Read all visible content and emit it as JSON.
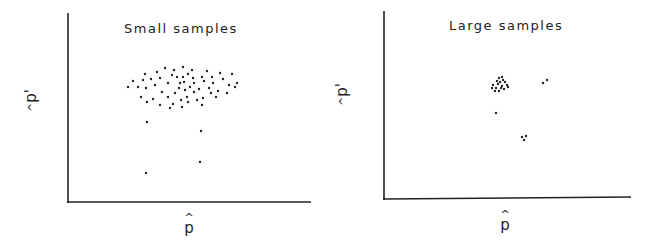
{
  "chart_data": [
    {
      "type": "scatter",
      "title": "Small samples",
      "xlabel": "p̂",
      "ylabel": "p̂'",
      "grid": false,
      "legend": null,
      "axis_ticks": "none",
      "pixel_frame": {
        "x0": 68,
        "y0": 202,
        "x1": 311,
        "y_top": 13
      },
      "points_px": [
        [
          128,
          87
        ],
        [
          133,
          81
        ],
        [
          138,
          87
        ],
        [
          141,
          97
        ],
        [
          143,
          80
        ],
        [
          145,
          74
        ],
        [
          146,
          88
        ],
        [
          147,
          102
        ],
        [
          151,
          79
        ],
        [
          153,
          99
        ],
        [
          155,
          85
        ],
        [
          157,
          72
        ],
        [
          160,
          78
        ],
        [
          160,
          105
        ],
        [
          162,
          92
        ],
        [
          165,
          68
        ],
        [
          168,
          83
        ],
        [
          168,
          97
        ],
        [
          170,
          108
        ],
        [
          172,
          75
        ],
        [
          173,
          104
        ],
        [
          174,
          70
        ],
        [
          175,
          93
        ],
        [
          177,
          77
        ],
        [
          179,
          88
        ],
        [
          180,
          83
        ],
        [
          181,
          100
        ],
        [
          182,
          107
        ],
        [
          183,
          67
        ],
        [
          184,
          82
        ],
        [
          185,
          90
        ],
        [
          187,
          97
        ],
        [
          188,
          74
        ],
        [
          188,
          102
        ],
        [
          190,
          87
        ],
        [
          192,
          70
        ],
        [
          193,
          78
        ],
        [
          194,
          83
        ],
        [
          194,
          92
        ],
        [
          197,
          100
        ],
        [
          199,
          89
        ],
        [
          202,
          105
        ],
        [
          203,
          98
        ],
        [
          204,
          81
        ],
        [
          202,
          77
        ],
        [
          207,
          71
        ],
        [
          209,
          88
        ],
        [
          211,
          93
        ],
        [
          212,
          77
        ],
        [
          213,
          83
        ],
        [
          216,
          97
        ],
        [
          218,
          91
        ],
        [
          220,
          73
        ],
        [
          223,
          79
        ],
        [
          227,
          93
        ],
        [
          229,
          85
        ],
        [
          232,
          74
        ],
        [
          235,
          87
        ],
        [
          237,
          83
        ],
        [
          183,
          77
        ],
        [
          147,
          122
        ],
        [
          201,
          131
        ],
        [
          200,
          162
        ],
        [
          146,
          173
        ]
      ],
      "clusters": [
        {
          "description": "dense main cloud",
          "count": 60,
          "approx_center_px": [
            183,
            87
          ]
        },
        {
          "description": "outliers",
          "count": 4
        }
      ]
    },
    {
      "type": "scatter",
      "title": "Large samples",
      "xlabel": "p̂",
      "ylabel": "p̂'",
      "grid": false,
      "legend": null,
      "axis_ticks": "none",
      "pixel_frame": {
        "x0": 384,
        "y0": 199,
        "x1": 631,
        "y_top": 11
      },
      "points_px": [
        [
          499,
          78
        ],
        [
          502,
          77
        ],
        [
          503,
          80
        ],
        [
          497,
          81
        ],
        [
          500,
          82
        ],
        [
          505,
          82
        ],
        [
          493,
          85
        ],
        [
          498,
          84
        ],
        [
          502,
          86
        ],
        [
          507,
          85
        ],
        [
          492,
          88
        ],
        [
          496,
          88
        ],
        [
          501,
          88
        ],
        [
          504,
          89
        ],
        [
          508,
          87
        ],
        [
          495,
          91
        ],
        [
          499,
          91
        ],
        [
          543,
          83
        ],
        [
          547,
          80
        ],
        [
          496,
          113
        ],
        [
          522,
          137
        ],
        [
          526,
          136
        ],
        [
          524,
          140
        ]
      ],
      "clusters": [
        {
          "description": "tight main cluster",
          "count": 17,
          "approx_center_px": [
            500,
            85
          ]
        },
        {
          "description": "pair upper right",
          "count": 2
        },
        {
          "description": "single point below cluster",
          "count": 1
        },
        {
          "description": "triplet lower right",
          "count": 3
        }
      ]
    }
  ],
  "panels": {
    "left": {
      "title": "Small samples",
      "x_label": "p",
      "y_label": "p",
      "hat": "^",
      "prime": "'"
    },
    "right": {
      "title": "Large samples",
      "x_label": "p",
      "y_label": "p",
      "hat": "^",
      "prime": "'"
    }
  }
}
